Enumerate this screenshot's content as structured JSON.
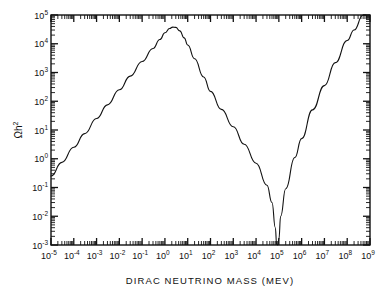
{
  "figure": {
    "background_color": "#ffffff",
    "line_color": "#111111"
  },
  "chart_data": {
    "type": "line",
    "title": "",
    "subtitle": "",
    "xlabel": "DIRAC NEUTRINO MASS   (MEV)",
    "xlabel_main": "DIRAC NEUTRINO MASS",
    "xlabel_unit": "(MEV)",
    "ylabel": "Ωh²",
    "ylabel_base": "Ωh",
    "ylabel_exponent": "2",
    "xscale": "log",
    "yscale": "log",
    "xlim": [
      1e-05,
      1000000000.0
    ],
    "ylim": [
      0.001,
      100000.0
    ],
    "grid": false,
    "legend": null,
    "legend_position": "none",
    "x_tick_labels": [
      {
        "base": "10",
        "exp": "-5",
        "value": 1e-05
      },
      {
        "base": "10",
        "exp": "-4",
        "value": 0.0001
      },
      {
        "base": "10",
        "exp": "-3",
        "value": 0.001
      },
      {
        "base": "10",
        "exp": "-2",
        "value": 0.01
      },
      {
        "base": "10",
        "exp": "-1",
        "value": 0.1
      },
      {
        "base": "10",
        "exp": "0",
        "value": 1
      },
      {
        "base": "10",
        "exp": "1",
        "value": 10
      },
      {
        "base": "10",
        "exp": "2",
        "value": 100
      },
      {
        "base": "10",
        "exp": "3",
        "value": 1000
      },
      {
        "base": "10",
        "exp": "4",
        "value": 10000
      },
      {
        "base": "10",
        "exp": "5",
        "value": 100000
      },
      {
        "base": "10",
        "exp": "6",
        "value": 1000000
      },
      {
        "base": "10",
        "exp": "7",
        "value": 10000000
      },
      {
        "base": "10",
        "exp": "8",
        "value": 100000000
      },
      {
        "base": "10",
        "exp": "9",
        "value": 1000000000
      }
    ],
    "y_tick_labels": [
      {
        "base": "10",
        "exp": "-3",
        "value": 0.001
      },
      {
        "base": "10",
        "exp": "-2",
        "value": 0.01
      },
      {
        "base": "10",
        "exp": "-1",
        "value": 0.1
      },
      {
        "base": "10",
        "exp": "0",
        "value": 1
      },
      {
        "base": "10",
        "exp": "1",
        "value": 10
      },
      {
        "base": "10",
        "exp": "2",
        "value": 100
      },
      {
        "base": "10",
        "exp": "3",
        "value": 1000
      },
      {
        "base": "10",
        "exp": "4",
        "value": 10000
      },
      {
        "base": "10",
        "exp": "5",
        "value": 100000
      }
    ],
    "series": [
      {
        "name": "Dirac neutrino relic density",
        "points": [
          [
            1e-05,
            0.25
          ],
          [
            3e-05,
            0.75
          ],
          [
            0.0001,
            2.5
          ],
          [
            0.0003,
            7.5
          ],
          [
            0.001,
            25.0
          ],
          [
            0.003,
            75.0
          ],
          [
            0.01,
            250.0
          ],
          [
            0.03,
            750.0
          ],
          [
            0.1,
            2400.0
          ],
          [
            0.3,
            6800.0
          ],
          [
            0.6,
            14000.0
          ],
          [
            1.0,
            24000.0
          ],
          [
            1.6,
            34000.0
          ],
          [
            2.2,
            38000.0
          ],
          [
            3.0,
            37000.0
          ],
          [
            4.5,
            28000.0
          ],
          [
            7.0,
            16000.0
          ],
          [
            10.0,
            9000.0
          ],
          [
            20.0,
            3000.0
          ],
          [
            50.0,
            700.0
          ],
          [
            100.0,
            220.0
          ],
          [
            300.0,
            52.0
          ],
          [
            1000.0,
            13.0
          ],
          [
            3000.0,
            3.2
          ],
          [
            10000.0,
            0.7
          ],
          [
            30000.0,
            0.12
          ],
          [
            50000.0,
            0.03
          ],
          [
            70000.0,
            0.004
          ],
          [
            80000.0,
            0.00105
          ],
          [
            90000.0,
            0.001
          ],
          [
            100000.0,
            0.0016
          ],
          [
            120000.0,
            0.01
          ],
          [
            200000.0,
            0.09
          ],
          [
            500000.0,
            1.1
          ],
          [
            1000000.0,
            5.0
          ],
          [
            3000000.0,
            50.0
          ],
          [
            10000000.0,
            350.0
          ],
          [
            30000000.0,
            2200.0
          ],
          [
            100000000.0,
            13000.0
          ],
          [
            200000000.0,
            30000.0
          ],
          [
            500000000.0,
            100000.0
          ],
          [
            650000000.0,
            100000.0
          ]
        ],
        "annotations": [
          {
            "label": "peak",
            "x": 2.2,
            "y": 38000
          },
          {
            "label": "minimum",
            "x": 85000,
            "y": 0.001
          }
        ]
      }
    ]
  }
}
